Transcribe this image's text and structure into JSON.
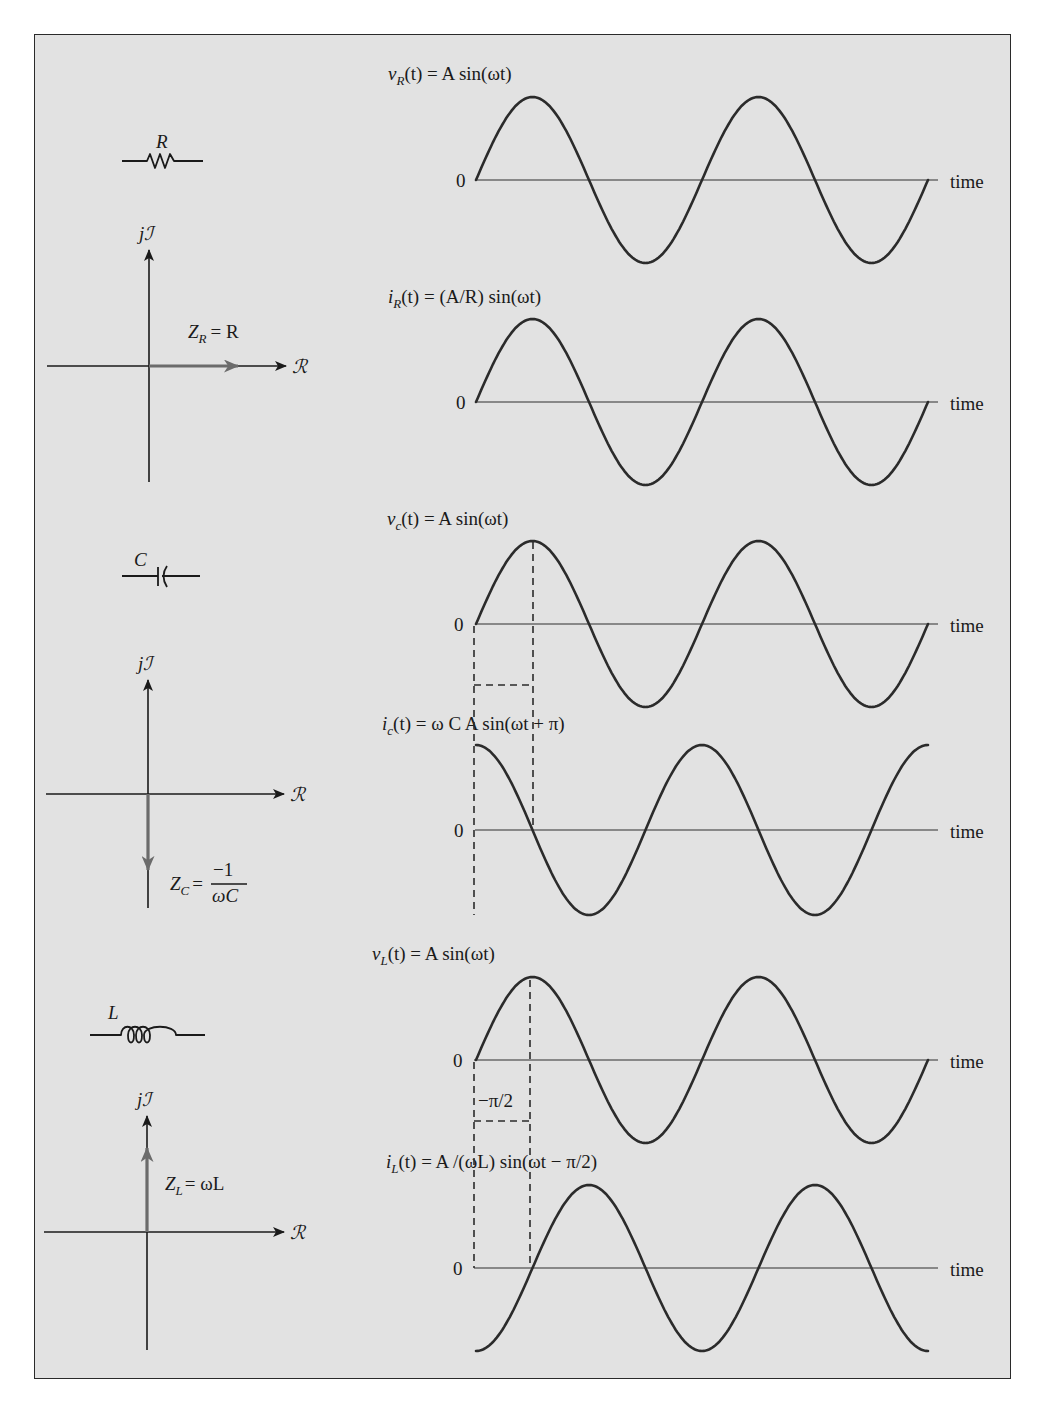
{
  "figure": {
    "background_color": "#e2e2e2",
    "border_color": "#2a2a2a",
    "wave_color": "#2b2b2b",
    "phasor_color": "#6b6b6b"
  },
  "common": {
    "time_label": "time",
    "zero_label": "0",
    "real_axis_label": "ℛ",
    "imag_axis_label": "jℐ"
  },
  "sections": {
    "resistor": {
      "component_label": "R",
      "impedance_label": "Z",
      "impedance_sub": "R",
      "impedance_rhs": "= R",
      "phasor_direction": "positive real",
      "voltage": {
        "name": "v",
        "sub": "R",
        "rhs": "(t) = A sin(ωt)"
      },
      "current": {
        "name": "i",
        "sub": "R",
        "rhs": "(t) = (A/R) sin(ωt)"
      }
    },
    "capacitor": {
      "component_label": "C",
      "impedance_label": "Z",
      "impedance_sub": "C",
      "impedance_eq": "=",
      "impedance_num": "−1",
      "impedance_den": "ωC",
      "phasor_direction": "negative imaginary",
      "voltage": {
        "name": "v",
        "sub": "c",
        "rhs": "(t) = A sin(ωt)"
      },
      "current": {
        "name": "i",
        "sub": "c",
        "rhs": "(t) = ω C A sin(ωt + π)"
      }
    },
    "inductor": {
      "component_label": "L",
      "impedance_label": "Z",
      "impedance_sub": "L",
      "impedance_rhs": "= ωL",
      "phasor_direction": "positive imaginary",
      "phase_shift_label": "−π/2",
      "voltage": {
        "name": "v",
        "sub": "L",
        "rhs": "(t) = A sin(ωt)"
      },
      "current": {
        "name": "i",
        "sub": "L",
        "rhs": "(t) = A /(ωL) sin(ωt − π/2)"
      }
    }
  },
  "chart_data": [
    {
      "type": "line",
      "title": "vR(t) = A sin(ωt)",
      "xlabel": "time",
      "ylabel": "",
      "x_periods": [
        0,
        2
      ],
      "function": "sin",
      "phase_rad": 0,
      "amplitude": "A",
      "ytick": "0",
      "grid": false
    },
    {
      "type": "line",
      "title": "iR(t) = (A/R) sin(ωt)",
      "xlabel": "time",
      "ylabel": "",
      "x_periods": [
        0,
        2
      ],
      "function": "sin",
      "phase_rad": 0,
      "amplitude": "A/R",
      "ytick": "0",
      "grid": false
    },
    {
      "type": "line",
      "title": "vc(t) = A sin(ωt)",
      "xlabel": "time",
      "ylabel": "",
      "x_periods": [
        0,
        2
      ],
      "function": "sin",
      "phase_rad": 0,
      "amplitude": "A",
      "ytick": "0",
      "grid": false
    },
    {
      "type": "line",
      "title": "ic(t) = ω C A sin(ωt + π)",
      "xlabel": "time",
      "ylabel": "",
      "x_periods": [
        0,
        2
      ],
      "function": "cos (drawn starting at maximum)",
      "phase_rad": 1.5708,
      "amplitude": "ωCA",
      "ytick": "0",
      "grid": false
    },
    {
      "type": "line",
      "title": "vL(t) = A sin(ωt)",
      "xlabel": "time",
      "ylabel": "",
      "x_periods": [
        0,
        2
      ],
      "function": "sin",
      "phase_rad": 0,
      "amplitude": "A",
      "ytick": "0",
      "grid": false
    },
    {
      "type": "line",
      "title": "iL(t) = A/(ωL) sin(ωt − π/2)",
      "xlabel": "time",
      "ylabel": "",
      "x_periods": [
        0,
        2
      ],
      "function": "sin",
      "phase_rad": -1.5708,
      "amplitude": "A/(ωL)",
      "ytick": "0",
      "annotation": "−π/2 phase shift marked with dashed lines",
      "grid": false
    }
  ]
}
